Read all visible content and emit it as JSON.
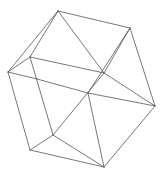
{
  "figure": {
    "type": "wireframe-polyhedron",
    "background": "#ffffff",
    "stroke": "#555555",
    "vertices": {
      "A": [
        58,
        11
      ],
      "B": [
        130,
        28
      ],
      "C": [
        8,
        72
      ],
      "D": [
        30,
        57
      ],
      "E": [
        104,
        73
      ],
      "F": [
        155,
        106
      ],
      "G": [
        88,
        93
      ],
      "H": [
        53,
        135
      ],
      "I": [
        30,
        150
      ],
      "J": [
        104,
        167
      ],
      "K": [
        37,
        79
      ]
    },
    "edges": [
      [
        "A",
        "B"
      ],
      [
        "A",
        "C"
      ],
      [
        "A",
        "D"
      ],
      [
        "A",
        "E"
      ],
      [
        "B",
        "F"
      ],
      [
        "B",
        "E"
      ],
      [
        "B",
        "G"
      ],
      [
        "C",
        "D"
      ],
      [
        "C",
        "K"
      ],
      [
        "C",
        "I"
      ],
      [
        "D",
        "E"
      ],
      [
        "D",
        "H"
      ],
      [
        "E",
        "F"
      ],
      [
        "E",
        "H"
      ],
      [
        "G",
        "F"
      ],
      [
        "G",
        "J"
      ],
      [
        "K",
        "G"
      ],
      [
        "F",
        "J"
      ],
      [
        "H",
        "I"
      ],
      [
        "H",
        "J"
      ],
      [
        "I",
        "J"
      ]
    ]
  }
}
